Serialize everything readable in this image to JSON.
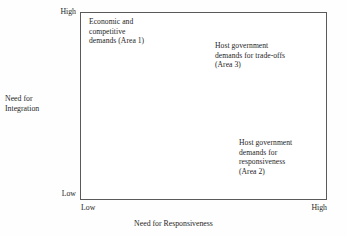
{
  "chart_data": {
    "type": "scatter",
    "title": "",
    "subtitle": "",
    "xlabel": "Need for Responsiveness",
    "ylabel": "Need for Integration",
    "xlim": [
      "Low",
      "High"
    ],
    "ylim": [
      "Low",
      "High"
    ],
    "x_tick_labels": [
      "Low",
      "High"
    ],
    "y_tick_labels": [
      "Low",
      "High"
    ],
    "grid": false,
    "legend": false,
    "legend_position": "none",
    "frame": "full-box",
    "annotations": [
      {
        "id": "area-1",
        "text": "Economic and\ncompetitive\ndemands (Area 1)",
        "quadrant": "top-left",
        "x": "Low",
        "y": "High"
      },
      {
        "id": "area-3",
        "text": "Host government\ndemands for trade-offs\n(Area 3)",
        "quadrant": "top-right",
        "x": "High",
        "y": "High"
      },
      {
        "id": "area-2",
        "text": "Host government\ndemands for\nresponsiveness\n(Area 2)",
        "quadrant": "bottom-right",
        "x": "High",
        "y": "Low"
      }
    ]
  },
  "axes": {
    "y": {
      "title": "Need for\nIntegration",
      "high_label": "High",
      "low_label": "Low"
    },
    "x": {
      "title": "Need for Responsiveness",
      "high_label": "High",
      "low_label": "Low"
    }
  },
  "quadrants": {
    "area1": "Economic and\ncompetitive\ndemands (Area 1)",
    "area3": "Host government\ndemands for trade-offs\n(Area 3)",
    "area2": "Host government\ndemands for\nresponsiveness\n(Area 2)"
  },
  "colors": {
    "frame": "#5a5a5a",
    "text": "#1e1e1e",
    "background": "#fefefe",
    "plot_background": "#ffffff"
  }
}
